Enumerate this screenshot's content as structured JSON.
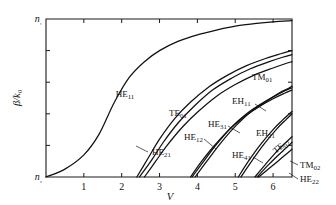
{
  "chart_data": {
    "type": "line",
    "title": "",
    "xlabel": "V",
    "ylabel": "β/k₀",
    "xlim": [
      0,
      6.5
    ],
    "ylim": [
      0,
      1
    ],
    "grid": false,
    "legend_position": "inline-annotations",
    "x_ticks": [
      "1",
      "2",
      "3",
      "4",
      "5",
      "6"
    ],
    "x_tick_values": [
      1,
      2,
      3,
      4,
      5,
      6
    ],
    "y_tick_labels": {
      "top": "n₁",
      "bottom": "n₂"
    },
    "y_minor_tick_count": 4,
    "series": [
      {
        "name": "HE11",
        "label": "HE",
        "sub": "11",
        "cutoff_V": 0.0,
        "points": [
          [
            0.0,
            0.0
          ],
          [
            0.5,
            0.05
          ],
          [
            1.0,
            0.14
          ],
          [
            1.4,
            0.27
          ],
          [
            1.8,
            0.47
          ],
          [
            2.2,
            0.63
          ],
          [
            2.6,
            0.73
          ],
          [
            3.0,
            0.8
          ],
          [
            3.5,
            0.86
          ],
          [
            4.0,
            0.9
          ],
          [
            4.5,
            0.93
          ],
          [
            5.0,
            0.955
          ],
          [
            5.5,
            0.97
          ],
          [
            6.0,
            0.982
          ],
          [
            6.5,
            0.99
          ]
        ]
      },
      {
        "name": "TE01",
        "label": "TE",
        "sub": "01",
        "cutoff_V": 2.4,
        "points": [
          [
            2.4,
            0.0
          ],
          [
            2.7,
            0.12
          ],
          [
            3.0,
            0.24
          ],
          [
            3.4,
            0.37
          ],
          [
            3.8,
            0.47
          ],
          [
            4.3,
            0.57
          ],
          [
            4.8,
            0.645
          ],
          [
            5.3,
            0.705
          ],
          [
            5.8,
            0.75
          ],
          [
            6.2,
            0.78
          ],
          [
            6.5,
            0.8
          ]
        ]
      },
      {
        "name": "HE21",
        "label": "HE",
        "sub": "21",
        "cutoff_V": 2.47,
        "points": [
          [
            2.47,
            0.0
          ],
          [
            2.8,
            0.11
          ],
          [
            3.1,
            0.22
          ],
          [
            3.5,
            0.345
          ],
          [
            3.9,
            0.445
          ],
          [
            4.4,
            0.55
          ],
          [
            4.9,
            0.625
          ],
          [
            5.4,
            0.685
          ],
          [
            5.9,
            0.73
          ],
          [
            6.25,
            0.758
          ],
          [
            6.5,
            0.775
          ]
        ]
      },
      {
        "name": "TM01",
        "label": "TM",
        "sub": "01",
        "cutoff_V": 2.6,
        "points": [
          [
            2.6,
            0.0
          ],
          [
            2.9,
            0.1
          ],
          [
            3.2,
            0.2
          ],
          [
            3.6,
            0.315
          ],
          [
            4.0,
            0.41
          ],
          [
            4.5,
            0.51
          ],
          [
            5.0,
            0.585
          ],
          [
            5.5,
            0.645
          ],
          [
            6.0,
            0.69
          ],
          [
            6.3,
            0.715
          ],
          [
            6.5,
            0.73
          ]
        ]
      },
      {
        "name": "HE12",
        "label": "HE",
        "sub": "12",
        "cutoff_V": 3.82,
        "points": [
          [
            3.82,
            0.0
          ],
          [
            4.1,
            0.095
          ],
          [
            4.4,
            0.185
          ],
          [
            4.8,
            0.29
          ],
          [
            5.2,
            0.375
          ],
          [
            5.6,
            0.44
          ],
          [
            6.0,
            0.495
          ],
          [
            6.3,
            0.53
          ],
          [
            6.5,
            0.55
          ]
        ]
      },
      {
        "name": "HE31",
        "label": "HE",
        "sub": "31",
        "cutoff_V": 3.86,
        "points": [
          [
            3.86,
            0.0
          ],
          [
            4.2,
            0.11
          ],
          [
            4.5,
            0.205
          ],
          [
            4.9,
            0.315
          ],
          [
            5.3,
            0.4
          ],
          [
            5.7,
            0.465
          ],
          [
            6.1,
            0.52
          ],
          [
            6.35,
            0.55
          ],
          [
            6.5,
            0.565
          ]
        ]
      },
      {
        "name": "EH11",
        "label": "EH",
        "sub": "11",
        "cutoff_V": 3.94,
        "points": [
          [
            3.94,
            0.0
          ],
          [
            4.25,
            0.1
          ],
          [
            4.6,
            0.21
          ],
          [
            5.0,
            0.32
          ],
          [
            5.4,
            0.41
          ],
          [
            5.8,
            0.475
          ],
          [
            6.15,
            0.53
          ],
          [
            6.4,
            0.56
          ],
          [
            6.5,
            0.575
          ]
        ]
      },
      {
        "name": "HE41",
        "label": "HE",
        "sub": "41",
        "cutoff_V": 5.08,
        "points": [
          [
            5.08,
            0.0
          ],
          [
            5.35,
            0.1
          ],
          [
            5.65,
            0.2
          ],
          [
            6.0,
            0.3
          ],
          [
            6.25,
            0.36
          ],
          [
            6.5,
            0.415
          ]
        ]
      },
      {
        "name": "EH21",
        "label": "EH",
        "sub": "21",
        "cutoff_V": 5.15,
        "points": [
          [
            5.15,
            0.0
          ],
          [
            5.45,
            0.105
          ],
          [
            5.75,
            0.205
          ],
          [
            6.1,
            0.305
          ],
          [
            6.35,
            0.365
          ],
          [
            6.5,
            0.4
          ]
        ]
      },
      {
        "name": "TE02",
        "label": "TE",
        "sub": "02",
        "cutoff_V": 5.52,
        "points": [
          [
            5.52,
            0.0
          ],
          [
            5.8,
            0.08
          ],
          [
            6.05,
            0.15
          ],
          [
            6.3,
            0.21
          ],
          [
            6.5,
            0.255
          ]
        ]
      },
      {
        "name": "TM02",
        "label": "TM",
        "sub": "02",
        "cutoff_V": 5.58,
        "points": [
          [
            5.58,
            0.0
          ],
          [
            5.85,
            0.07
          ],
          [
            6.1,
            0.13
          ],
          [
            6.35,
            0.185
          ],
          [
            6.5,
            0.22
          ]
        ]
      },
      {
        "name": "HE22",
        "label": "HE",
        "sub": "22",
        "cutoff_V": 5.62,
        "points": [
          [
            5.62,
            0.0
          ],
          [
            5.9,
            0.055
          ],
          [
            6.15,
            0.105
          ],
          [
            6.4,
            0.155
          ],
          [
            6.5,
            0.175
          ]
        ]
      }
    ],
    "annotations": [
      {
        "id": "HE11",
        "label": "HE",
        "sub": "11",
        "x": 125,
        "y": 97,
        "anchor": "middle",
        "leader": null
      },
      {
        "id": "TE01",
        "label": "TE",
        "sub": "01",
        "x": 178,
        "y": 116,
        "anchor": "middle",
        "leader": null
      },
      {
        "id": "HE21",
        "label": "HE",
        "sub": "21",
        "x": 152,
        "y": 155,
        "anchor": "start",
        "leader": [
          148,
          152,
          136,
          146
        ]
      },
      {
        "id": "HE12",
        "label": "HE",
        "sub": "12",
        "x": 184,
        "y": 140,
        "anchor": "start",
        "leader": [
          204,
          139,
          216,
          149
        ]
      },
      {
        "id": "HE31",
        "label": "HE",
        "sub": "31",
        "x": 208,
        "y": 127,
        "anchor": "start",
        "leader": [
          228,
          126,
          240,
          133
        ]
      },
      {
        "id": "TM01",
        "label": "TM",
        "sub": "01",
        "x": 252,
        "y": 80,
        "anchor": "start",
        "leader": null
      },
      {
        "id": "EH11",
        "label": "EH",
        "sub": "11",
        "x": 232,
        "y": 104,
        "anchor": "start",
        "leader": [
          255,
          104,
          266,
          111
        ]
      },
      {
        "id": "EH21",
        "label": "EH",
        "sub": "21",
        "x": 256,
        "y": 136,
        "anchor": "start",
        "leader": null
      },
      {
        "id": "HE41",
        "label": "HE",
        "sub": "41",
        "x": 232,
        "y": 158,
        "anchor": "start",
        "leader": [
          253,
          157,
          263,
          163
        ]
      },
      {
        "id": "TE02",
        "label": "TE",
        "sub": "02",
        "x": 276,
        "y": 154,
        "anchor": "start",
        "rotate": -40,
        "leader": null
      },
      {
        "id": "TM02",
        "label": "TM",
        "sub": "02",
        "x": 300,
        "y": 168,
        "anchor": "start",
        "leader": [
          298,
          165,
          290,
          161
        ]
      },
      {
        "id": "HE22",
        "label": "HE",
        "sub": "22",
        "x": 300,
        "y": 182,
        "anchor": "start",
        "leader": [
          298,
          179,
          289,
          173
        ]
      }
    ]
  },
  "axes": {
    "y_top_label": "n₁",
    "y_bottom_label": "n₂",
    "y_axis_title_main": "β/",
    "y_axis_title_k": "k",
    "y_axis_title_sub": "0",
    "x_axis_title": "V"
  },
  "colors": {
    "curve": "#111111",
    "axis": "#1a1a1a",
    "background": "#ffffff"
  }
}
